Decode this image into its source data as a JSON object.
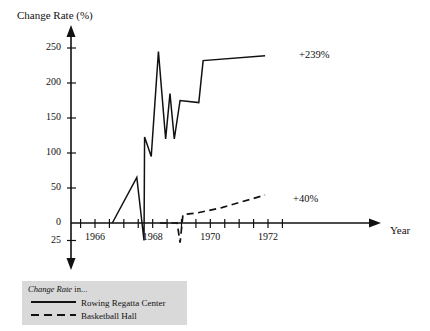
{
  "chart_data": {
    "type": "line",
    "title": "",
    "ylabel": "Change Rate (%)",
    "xlabel": "Year",
    "ylim": [
      -25,
      265
    ],
    "xlim": [
      1965.0,
      1973.6
    ],
    "grid": false,
    "y_ticks": [
      250,
      200,
      150,
      100,
      50,
      0,
      25
    ],
    "y_tick_labels": [
      "250",
      "200",
      "150",
      "100",
      "50",
      "0",
      "25"
    ],
    "y_tick_values": [
      250,
      200,
      150,
      100,
      50,
      0,
      -25
    ],
    "x_ticks": [
      1965.5,
      1966,
      1966.5,
      1967,
      1967.5,
      1968,
      1968.5,
      1969,
      1969.5,
      1970,
      1970.5,
      1971,
      1971.5,
      1972,
      1972.5
    ],
    "x_tick_labels": [
      "1966",
      "1968",
      "1970",
      "1972"
    ],
    "x_labeled_ticks": [
      1966,
      1968,
      1970,
      1972
    ],
    "legend_title": "Change Rate in...",
    "legend_position": "bottom-left",
    "series": [
      {
        "name": "Rowing Regatta Center",
        "style": "solid",
        "color": "#111111",
        "end_annotation": "+239%",
        "points": [
          [
            1966.6,
            0
          ],
          [
            1967.45,
            65
          ],
          [
            1967.7,
            -25
          ],
          [
            1967.72,
            123
          ],
          [
            1967.95,
            95
          ],
          [
            1968.2,
            245
          ],
          [
            1968.45,
            120
          ],
          [
            1968.6,
            185
          ],
          [
            1968.75,
            120
          ],
          [
            1968.95,
            175
          ],
          [
            1969.6,
            172
          ],
          [
            1969.75,
            232
          ],
          [
            1971.9,
            239
          ]
        ]
      },
      {
        "name": "Basketball Hall",
        "style": "dashed",
        "color": "#111111",
        "end_annotation": "+40%",
        "points": [
          [
            1968.25,
            0
          ],
          [
            1968.85,
            0
          ],
          [
            1968.95,
            -28
          ],
          [
            1969.05,
            12
          ],
          [
            1969.5,
            14
          ],
          [
            1970.4,
            22
          ],
          [
            1971.9,
            40
          ]
        ]
      }
    ]
  },
  "annotations": {
    "solid_end": "+239%",
    "dashed_end": "+40%"
  },
  "axis": {
    "y_title": "Change Rate (%)",
    "x_title": "Year"
  },
  "legend": {
    "title_italic": "Change Rate",
    "title_plain": " in...",
    "items": [
      {
        "label": "Rowing Regatta Center",
        "style": "solid"
      },
      {
        "label": "Basketball Hall",
        "style": "dashed"
      }
    ]
  }
}
